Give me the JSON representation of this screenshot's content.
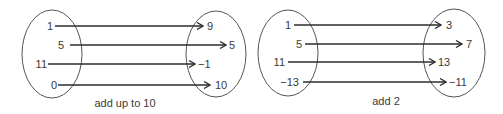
{
  "diagrams": [
    {
      "caption": "add up to 10",
      "domain": [
        "1",
        "5",
        "11",
        "0"
      ],
      "range": [
        "9",
        "5",
        "−1",
        "10"
      ],
      "mappings": [
        [
          "1",
          "9"
        ],
        [
          "5",
          "5"
        ],
        [
          "11",
          "−1"
        ],
        [
          "0",
          "10"
        ]
      ]
    },
    {
      "caption": "add 2",
      "domain": [
        "1",
        "5",
        "11",
        "−13"
      ],
      "range": [
        "3",
        "7",
        "13",
        "−11"
      ],
      "mappings": [
        [
          "1",
          "3"
        ],
        [
          "5",
          "7"
        ],
        [
          "11",
          "13"
        ],
        [
          "−13",
          "−11"
        ]
      ]
    }
  ],
  "colors": {
    "line": "#2d2d2d",
    "ellipse": "#555555",
    "text": "#3a3a3a",
    "background": "#ffffff"
  }
}
